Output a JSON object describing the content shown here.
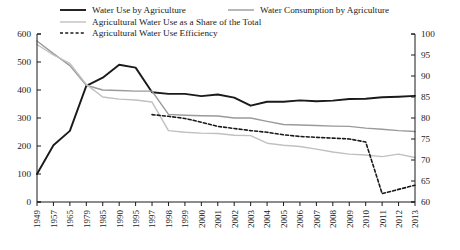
{
  "chart_data": {
    "type": "line",
    "title": "",
    "xlabel": "",
    "ylabel_left": "",
    "ylabel_right": "",
    "grid": false,
    "legend_position": "top",
    "x": [
      "1949",
      "1957",
      "1965",
      "1979",
      "1985",
      "1990",
      "1995",
      "1997",
      "1998",
      "1999",
      "2000",
      "2001",
      "2002",
      "2003",
      "2004",
      "2005",
      "2006",
      "2007",
      "2008",
      "2009",
      "2010",
      "2011",
      "2012",
      "2013"
    ],
    "left_axis": {
      "min": 0,
      "max": 600,
      "ticks": [
        "0",
        "100",
        "200",
        "300",
        "400",
        "500",
        "600"
      ]
    },
    "right_axis": {
      "min": 60,
      "max": 100,
      "ticks": [
        "60",
        "65",
        "70",
        "75",
        "80",
        "85",
        "90",
        "95",
        "100"
      ]
    },
    "series": [
      {
        "name": "Water Use by Agriculture",
        "axis": "left",
        "color": "#1a1a1a",
        "style": "solid",
        "width": 1.9,
        "values": [
          100,
          203,
          254,
          415,
          444,
          490,
          480,
          392,
          386,
          386,
          378,
          384,
          373,
          344,
          358,
          358,
          363,
          360,
          362,
          368,
          369,
          374,
          376,
          379
        ]
      },
      {
        "name": "Water Consumption by Agriculture",
        "axis": "left",
        "color": "#9a9a9a",
        "style": "solid",
        "width": 1.4,
        "values": [
          575,
          530,
          487,
          417,
          400,
          398,
          396,
          396,
          313,
          310,
          308,
          307,
          300,
          300,
          288,
          277,
          275,
          273,
          271,
          270,
          264,
          260,
          255,
          252
        ]
      },
      {
        "name": "Agricultural Water Use as a Share of the Total",
        "axis": "right",
        "color": "#c0c0c0",
        "style": "solid",
        "width": 1.4,
        "values": [
          97.5,
          95.0,
          93.0,
          88.0,
          85.0,
          84.5,
          84.3,
          83.8,
          77.0,
          76.6,
          76.4,
          76.3,
          75.9,
          75.8,
          74.0,
          73.5,
          73.2,
          72.6,
          71.9,
          71.4,
          71.2,
          70.8,
          71.4,
          70.6
        ]
      },
      {
        "name": "Agricultural Water Use Efficiency",
        "axis": "right",
        "color": "#1a1a1a",
        "style": "dashed",
        "width": 1.6,
        "values": [
          null,
          null,
          null,
          null,
          null,
          null,
          null,
          80.8,
          80.4,
          79.9,
          79.0,
          78.0,
          77.5,
          77.0,
          76.6,
          76.0,
          75.6,
          75.4,
          75.2,
          75.0,
          74.3,
          62.0,
          63.0,
          64.0
        ]
      }
    ]
  },
  "legend": {
    "items": [
      {
        "label": "Water Use by Agriculture",
        "style": "solid",
        "color": "#1a1a1a"
      },
      {
        "label": "Water Consumption by Agriculture",
        "style": "solid",
        "color": "#9a9a9a"
      },
      {
        "label": "Agricultural Water Use as a Share of the Total",
        "style": "solid",
        "color": "#c0c0c0"
      },
      {
        "label": "Agricultural Water Use Efficiency",
        "style": "dashed",
        "color": "#1a1a1a"
      }
    ]
  }
}
